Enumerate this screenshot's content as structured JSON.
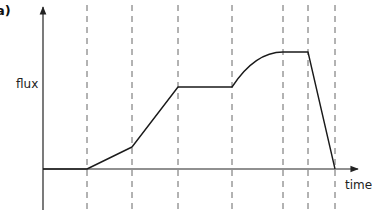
{
  "panel_label": "a)",
  "chart_data": {
    "type": "line",
    "title": "",
    "xlabel": "time",
    "ylabel": "flux",
    "grid": false,
    "axes": {
      "x_ticks": [],
      "y_ticks": [],
      "arrows": true
    },
    "phase_boundaries_px": [
      87,
      132,
      178,
      232,
      283,
      308,
      335
    ],
    "segments": [
      {
        "from": [
          43,
          169
        ],
        "to": [
          87,
          169
        ],
        "shape": "flat"
      },
      {
        "from": [
          87,
          169
        ],
        "to": [
          132,
          147
        ],
        "shape": "linear"
      },
      {
        "from": [
          132,
          147
        ],
        "to": [
          178,
          87
        ],
        "shape": "linear"
      },
      {
        "from": [
          178,
          87
        ],
        "to": [
          232,
          87
        ],
        "shape": "flat"
      },
      {
        "from": [
          232,
          87
        ],
        "to": [
          283,
          52
        ],
        "shape": "concave-curve"
      },
      {
        "from": [
          283,
          52
        ],
        "to": [
          308,
          52
        ],
        "shape": "flat"
      },
      {
        "from": [
          308,
          52
        ],
        "to": [
          335,
          169
        ],
        "shape": "linear"
      }
    ],
    "series": [
      {
        "name": "flux",
        "points_relative": [
          {
            "t": 0,
            "flux": 0
          },
          {
            "t": 1,
            "flux": 0
          },
          {
            "t": 2,
            "flux": 0.19
          },
          {
            "t": 3,
            "flux": 0.7
          },
          {
            "t": 4,
            "flux": 0.7
          },
          {
            "t": 5,
            "flux": 1.0
          },
          {
            "t": 6,
            "flux": 1.0
          },
          {
            "t": 7,
            "flux": 0
          }
        ]
      }
    ],
    "legend": null
  },
  "colors": {
    "axis": "#222222",
    "curve": "#1a1a1a",
    "dashed": "#666666"
  }
}
